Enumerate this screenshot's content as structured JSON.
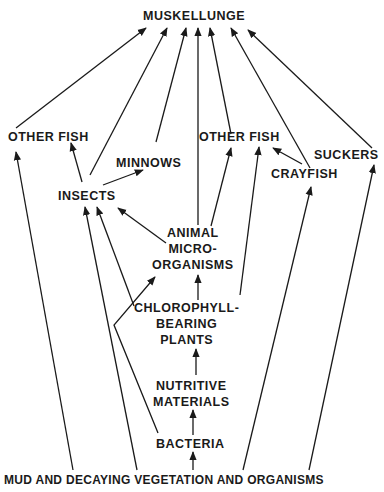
{
  "diagram": {
    "type": "food-web",
    "nodes": {
      "muskellunge": {
        "label": "MUSKELLUNGE"
      },
      "other_fish_left": {
        "label": "OTHER FISH"
      },
      "minnows": {
        "label": "MINNOWS"
      },
      "insects": {
        "label": "INSECTS"
      },
      "other_fish_right": {
        "label": "OTHER FISH"
      },
      "suckers": {
        "label": "SUCKERS"
      },
      "crayfish": {
        "label": "CRAYFISH"
      },
      "animal_micro": {
        "lines": [
          "ANIMAL",
          "MICRO-",
          "ORGANISMS"
        ]
      },
      "chlorophyll": {
        "lines": [
          "CHLOROPHYLL-",
          "BEARING",
          "PLANTS"
        ]
      },
      "nutritive": {
        "lines": [
          "NUTRITIVE",
          "MATERIALS"
        ]
      },
      "bacteria": {
        "label": "BACTERIA"
      },
      "mud": {
        "label": "MUD AND DECAYING VEGETATION AND ORGANISMS"
      }
    },
    "edges": [
      {
        "from": "other_fish_left",
        "to": "muskellunge"
      },
      {
        "from": "insects",
        "to": "muskellunge"
      },
      {
        "from": "minnows",
        "to": "muskellunge"
      },
      {
        "from": "animal_micro",
        "to": "muskellunge"
      },
      {
        "from": "other_fish_right",
        "to": "muskellunge"
      },
      {
        "from": "crayfish",
        "to": "muskellunge"
      },
      {
        "from": "suckers",
        "to": "muskellunge"
      },
      {
        "from": "insects",
        "to": "other_fish_left"
      },
      {
        "from": "insects",
        "to": "minnows"
      },
      {
        "from": "animal_micro",
        "to": "insects"
      },
      {
        "from": "animal_micro",
        "to": "other_fish_right"
      },
      {
        "from": "chlorophyll",
        "to": "insects"
      },
      {
        "from": "chlorophyll",
        "to": "animal_micro"
      },
      {
        "from": "chlorophyll",
        "to": "other_fish_right"
      },
      {
        "from": "crayfish",
        "to": "other_fish_right"
      },
      {
        "from": "nutritive",
        "to": "chlorophyll"
      },
      {
        "from": "bacteria",
        "to": "nutritive"
      },
      {
        "from": "bacteria",
        "to": "animal_micro"
      },
      {
        "from": "mud",
        "to": "bacteria"
      },
      {
        "from": "mud",
        "to": "other_fish_left"
      },
      {
        "from": "mud",
        "to": "insects"
      },
      {
        "from": "mud",
        "to": "crayfish"
      },
      {
        "from": "mud",
        "to": "suckers"
      }
    ]
  }
}
